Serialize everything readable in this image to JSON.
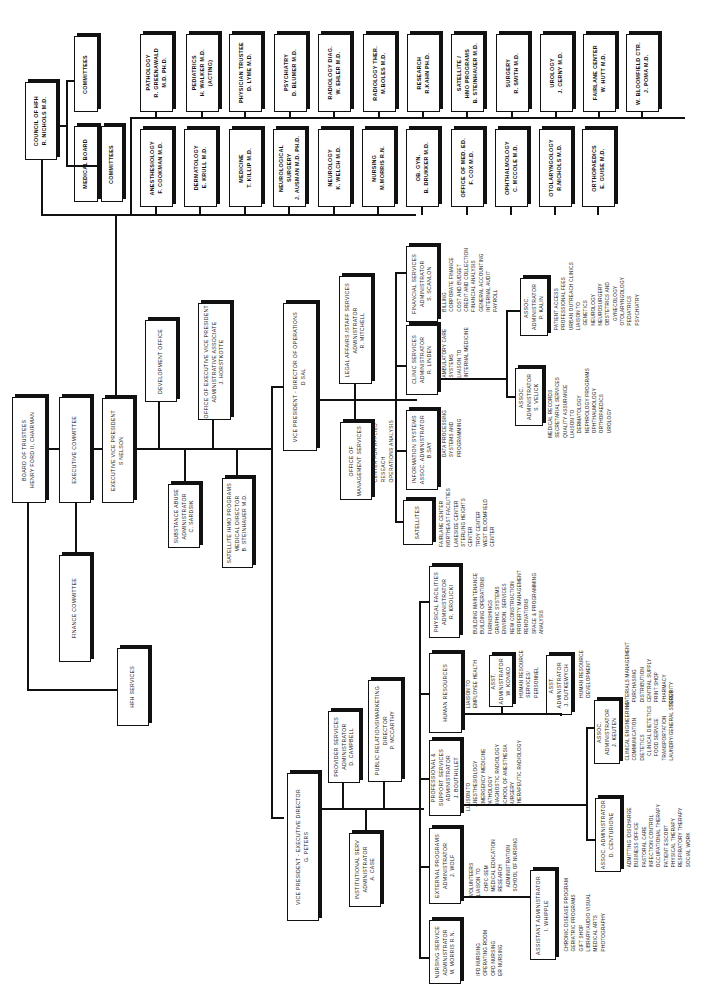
{
  "chart_title": "Organizational Chart (rotated)",
  "governance": {
    "board": "BOARD OF TRUSTEES\nHENRY FORD II, CHAIRMAN",
    "executive_committee": "EXECUTIVE COMMITTEE",
    "finance_committee": "FINANCE COMMITTEE",
    "hfh_services": "HFH SERVICES",
    "evp": "EXECUTIVE VICE PRESIDENT\nS NELSON",
    "development_office": "DEVELOPMENT OFFICE",
    "office_evp": "OFFICE OF EXECUTIVE VICE PRESIDENT\nADMINISTRATIVE ASSOCIATE\nJ. HORSTKOTTE",
    "substance_abuse": "SUBSTANCE ABUSE\nADMINISTRATOR\nC. SARDSIK",
    "satellite_hmo": "SATELLITE /HMO PROGRAMS\nMEDICAL DIRECTOR\nB. STEINHAUER M.D."
  },
  "medical": {
    "council": "COUNCIL OF HFH\nR. NICHOLS M.D.",
    "committees_top": "COMMITTEES",
    "medical_board": "MEDICAL BOARD",
    "committees_bottom": "COMMITTEES",
    "departments_top": [
      "PATHOLOGY\nR. GREENAWALD\nM.D. PH.D.",
      "PEDIATRICS\nH. WALKER M.D.\n(ACTING)",
      "PHYSICIAN TRUSTEE\nD. LYME M.D.",
      "PSYCHIATRY\nD. BLUMER M.D.",
      "RADIOLOGY DIAG.\nW. EHLER M.D.",
      "RADIOLOGY THER.\nM.BOLES M.D.",
      "RESEARCH\nR.KAHN PH.D.",
      "SATELLITE /\nHMO PROGRAMS\nB. STEINHAUER M.D.",
      "SURGERY\nR. SMITH M.D.",
      "UROLOGY\nJ. CERNY M.D.",
      "FAIRLANE CENTER\nW. HUTT M.D.",
      "W. BLOOMFIELD CTR.\nJ. POMA M.D."
    ],
    "departments_bottom": [
      "ANESTHESIOLOGY\nF. COOKMAN M.D.",
      "DERMATOLOGY\nE. KRULL M.D.",
      "MEDICINE\nT. KILLIP M.D.",
      "NEUROLOGICAL SURGERY\nJ. AUSMAN M.D. PH.D.",
      "NEUROLOGY\nK. WELCH M.D.",
      "NURSING\nM.MORRIS R.N.",
      "OB. GYN.\nB. DRUKKER M.D.",
      "OFFICE OF MED. ED.\nF. COX M.D.",
      "OPHTHALMOLOGY\nC. McCOLE M.D.",
      "OTOLARYNGOLOGY\nR.NICHOLS M.D.",
      "ORTHOPAEDICS\nE. GUISE M.D."
    ]
  },
  "operations": {
    "vp": "VICE PRESIDENT - DIRECTOR OF OPERATIONS\nD SAL",
    "legal": "LEGAL AFFAIRS /STAFF SERVICES\nADMINISTRATOR\nR. MITCHELL",
    "management_services": "OFFICE OF\nMANAGEMENT SERVICES",
    "management_note": "CENTER FOR APPLIED\nRESEACH\nOPERATIONS ANALYSIS",
    "financial": "FINANCIAL SERVICES\nADMINISTRATOR\nS. SCANLON",
    "financial_note": "BILLING\nCORPORATE FINANCE\nCOST AND BUDGET\nCREDIT AND COLLECTION\nFINANCIAL ANALYSIS\nGENERAL ACCOUNTING\nINTERNAL AUDIT\nPAYROLL",
    "clinic": "CLINIC SERVICES\nADMINISTRATOR\nR. LINDEN",
    "clinic_note": "AMBULATORY CARE\nSYSTEMS\nLIAISON TO\nINTERNAL MEDICINE",
    "info_systems": "INFORMATION SYSTEMS\nASSOC. ADMINISTRATOR\nB.SAY",
    "info_note": "DATA PROCESSING\nSYSTEMS and\nPROGRAMMING",
    "satellites": "SATELLITES",
    "satellites_note": "FAIRLANE CENTER\nNORTHEAST FACILITIES\nLAKESIDE CENTER\nSTERLING HEIGHTS\nCENTER\nTROY CENTER\nWEST BLOOMFIELD\nCENTER",
    "assoc_kalin": "ASSOC. ADMINISTRATOR\nP. KALIN",
    "kalin_note": "PATIENT ACCESS\nPROFESSIONAL FEES\nURBAN OUTREACH CLINICS\nLIAISON TO\n   GENETICS\n   NEUROLOGY\n   NEUROSURGERY\n   OBSTETRICS AND\n      GYNECOLOGY\n   OTOLARYNGOLOGY\n   PEDIATRICS\n   PSYCHIATRY",
    "assoc_velick": "ASSOC. ADMINISTRATOR\nS. VELICK",
    "velick_note": "MEDICAL RECORDS\nSECRETARIAL SERVICES\nQUALITY ASSURANCE\nLIAISON TO\n   DERMATOLOGY\n   NEPHROLOGY PROGRAMS\n   OPHTHALMOLOGY\n   ORTHOPAEDICS\n   UROLOGY"
  },
  "executive_director": {
    "vp": "VICE PRESIDENT - EXECUTIVE DIRECTOR\nG. PETERS",
    "provider": "PROVIDER SERVICES\nADMINISTRATOR\nD. CAMPBELL",
    "public_relations": "PUBLIC RELATIONS/MARKETING\nDIRECTOR\nP. McCARTHY",
    "institutional": "INSTITUTIONAL SERV\nADMINISTRATOR\nA. CASE",
    "physical": "PHYSICAL FACILITIES\nADMINISTRATOR\nR. KROLICKI",
    "physical_note": "BUILDING MAINTENANCE\nBUILDING OPERATIONS\nFURNISHINGS\nGRAPHIC SYSTEMS\nENVIRON. SERVICES\nNEW CONSTRUCTION\nPROPERTY MANAGEMENT\nRENOVATIONS\nSPACE & PROGRAMMING\nANALYSIS",
    "human_resources": "HUMAN RESOURCES",
    "hr_note": "LIAISON TO\nEMPLOYEE HEALTH",
    "asst_konko": "ASST.\nADMINISTRATOR\nW. KONKO",
    "konko_note": "HUMAN RESOURCE\nSERVICES/\nPERSONNEL",
    "asst_dutkewych": "ASST.\nADMINISTRATOR\nJ. DUTKEWYCH",
    "dutkewych_note": "HUMAN RESOURCE\nDEVELOPMENT",
    "professional": "PROFESSIONAL &\nSUPPORT SERVICES\nADMINISTRATOR\nJ. BOUTHILLET",
    "professional_note": "LIAISON TO\n   ANESTHESIOLOGY\n   EMERGENCY MEDICINE\n   PATHOLOGY\n   DIAGNOSTIC RADIOLOGY\n   SCHOOL OF ANESTHESIA\n   SURGERY\n   THERAPEUTIC RADIOLOGY",
    "assoc_keuten": "ASSOC. ADMINISTRATOR\nJ. KEUTEN",
    "keuten_note_a": "CLINICAL ENGINEERING\nCOMMUNICATION\nDIETETICS\n   CLINICAL DIETETICS\n   FOOD SERVICE\nTRANSPORTATION\nLAUNDRY/GENERAL STORES",
    "keuten_note_b": "MATERIALS MANAGEMENT\n   PURCHASING\n   DISTRIBUTION\n   CENTRAL SUPPLY\n   PRINT SHOP\n   PHARMACY\nSECURITY",
    "assoc_centurione": "ASSOC. ADMINISTRATOR\nD. CENTURIONE",
    "centurione_note": "ADMITTING /DISCHARGE\nBUSINESS OFFICE\nPASTORAL CARE\nINFECTION CONTROL\nOCCUPATIONAL THERAPY\nPATIENT ESCORT\nPHYSICAL THERAPY\nRESPIRATORY THERAPY\nSOCIAL WORK",
    "external": "EXTERNAL PROGRAMS\nADMINISTRATOR\nJ. WOLF",
    "external_note": "VOLUNTEERS\nLIAISON TO\n   CHPC-SEM\n   MEDICAL EDUCATION\n   RESEARCH\n      ADMINISTRATION\n   SCHOOL OF NURSING",
    "asst_whipple": "ASSISTANT ADMINISTRATOR\nI. WHIPPLE",
    "whipple_note": "CHRONIC DISEASE PROGRAM\nGERIATRIC PROGRAMS\nGIFT SHOP\nLIBRARY/AUDIO VISUAL\nMEDICAL ARTS\nPHOTOGRAPHY",
    "nursing": "NURSING SERVICE\nADMINISTRATOR\nM. MORRIS R.N.",
    "nursing_note": "IPD NURSING\nOPERATING ROOM\nOPD NURSING\nER NURSING"
  }
}
